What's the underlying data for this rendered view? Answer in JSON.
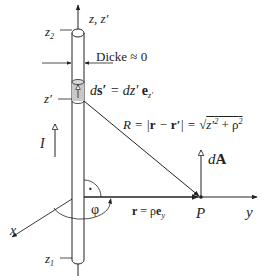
{
  "diagram": {
    "colors": {
      "stroke": "#222222",
      "segment_fill": "#c8c8c8",
      "background": "#ffffff"
    },
    "labels": {
      "z_axis": "z, z′",
      "z2": "z",
      "z2_sub": "2",
      "z1": "z",
      "z1_sub": "1",
      "z_prime": "z′",
      "thickness": "Dicke ≈ 0",
      "ds_lhs": "d",
      "ds_bold": "s′",
      "ds_mid": " = dz′ ",
      "ds_e": "e",
      "ds_sub": "z′",
      "R_formula_a": "R = |",
      "R_formula_b": "r",
      "R_formula_c": " − ",
      "R_formula_d": "r′",
      "R_formula_e": "| = ",
      "R_formula_sqrt": "√",
      "R_formula_f": "z′",
      "R_formula_sup": "2",
      "R_formula_g": " + ρ",
      "R_formula_sup2": "2",
      "current": "I",
      "dA_d": "d",
      "dA_A": "A",
      "phi": "φ",
      "r_vec_bold": "r",
      "r_vec_mid": " = ρ",
      "r_vec_e": "e",
      "r_vec_sub": "y",
      "P": "P",
      "y_axis": "y",
      "x_axis": "x",
      "right_angle_dot": "·"
    }
  }
}
